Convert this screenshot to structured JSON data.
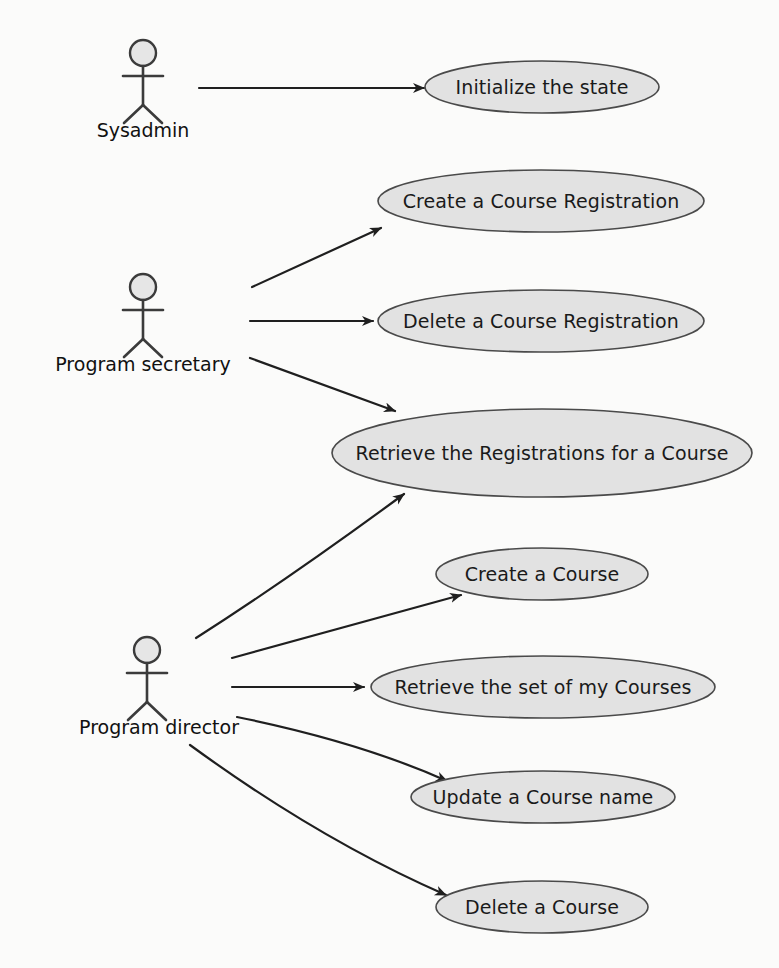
{
  "diagram": {
    "type": "uml-use-case-diagram",
    "title": "",
    "background_color": "#fbfbfa",
    "ellipse_fill": "#e2e2e2",
    "ellipse_stroke": "#4a4a4a",
    "line_color": "#1f1f1f",
    "actors": [
      {
        "id": "sysadmin",
        "label": "Sysadmin",
        "x": 143,
        "y": 53,
        "label_x": 143,
        "label_y": 131
      },
      {
        "id": "program-secretary",
        "label": "Program secretary",
        "x": 143,
        "y": 287,
        "label_x": 143,
        "label_y": 365
      },
      {
        "id": "program-director",
        "label": "Program director",
        "x": 147,
        "y": 650,
        "label_x": 159,
        "label_y": 728
      }
    ],
    "use_cases": [
      {
        "id": "initialize-the-state",
        "label": "Initialize the state",
        "cx": 542,
        "cy": 87,
        "rx": 117,
        "ry": 26
      },
      {
        "id": "create-a-course-registration",
        "label": "Create a Course Registration",
        "cx": 541,
        "cy": 201,
        "rx": 163,
        "ry": 31
      },
      {
        "id": "delete-a-course-registration",
        "label": "Delete a Course Registration",
        "cx": 541,
        "cy": 321,
        "rx": 163,
        "ry": 31
      },
      {
        "id": "retrieve-the-registrations-for-a-course",
        "label": "Retrieve the Registrations for a Course",
        "cx": 542,
        "cy": 453,
        "rx": 210,
        "ry": 44
      },
      {
        "id": "create-a-course",
        "label": "Create a Course",
        "cx": 542,
        "cy": 574,
        "rx": 106,
        "ry": 26
      },
      {
        "id": "retrieve-the-set-of-my-courses",
        "label": "Retrieve the set of my Courses",
        "cx": 543,
        "cy": 687,
        "rx": 172,
        "ry": 31
      },
      {
        "id": "update-a-course-name",
        "label": "Update a Course name",
        "cx": 543,
        "cy": 797,
        "rx": 132,
        "ry": 26
      },
      {
        "id": "delete-a-course",
        "label": "Delete a Course",
        "cx": 542,
        "cy": 907,
        "rx": 106,
        "ry": 26
      }
    ],
    "associations": [
      {
        "id": "sysadmin-to-initialize-the-state",
        "from": "Sysadmin",
        "to": "Initialize the state",
        "path": "M 199 88 L 424 88"
      },
      {
        "id": "program-secretary-to-create-a-course-registration",
        "from": "Program secretary",
        "to": "Create a Course Registration",
        "path": "M 252 287 L 381 228"
      },
      {
        "id": "program-secretary-to-delete-a-course-registration",
        "from": "Program secretary",
        "to": "Delete a Course Registration",
        "path": "M 250 321 L 373 321"
      },
      {
        "id": "program-secretary-to-retrieve-the-registrations-for-a-course",
        "from": "Program secretary",
        "to": "Retrieve the Registrations for a Course",
        "path": "M 250 358 L 395 411"
      },
      {
        "id": "program-director-to-retrieve-the-registrations-for-a-course",
        "from": "Program director",
        "to": "Retrieve the Registrations for a Course",
        "path": "M 196 638 Q 290 578 404 494"
      },
      {
        "id": "program-director-to-create-a-course",
        "from": "Program director",
        "to": "Create a Course",
        "path": "M 232 658 L 461 595"
      },
      {
        "id": "program-director-to-retrieve-the-set-of-my-courses",
        "from": "Program director",
        "to": "Retrieve the set of my Courses",
        "path": "M 232 687 L 364 687"
      },
      {
        "id": "program-director-to-update-a-course-name",
        "from": "Program director",
        "to": "Update a Course name",
        "path": "M 237 717 Q 360 742 447 781"
      },
      {
        "id": "program-director-to-delete-a-course",
        "from": "Program director",
        "to": "Delete a Course",
        "path": "M 190 745 Q 320 840 446 895"
      }
    ]
  }
}
